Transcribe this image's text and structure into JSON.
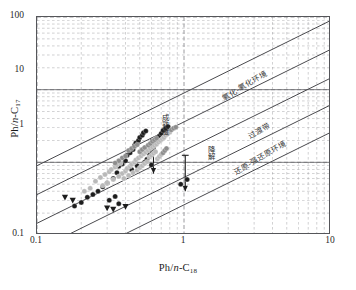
{
  "axes": {
    "x_title_pre": "Ph/",
    "x_title_it": "n",
    "x_title_post": "-C",
    "x_title_sub": "18",
    "y_title_pre": "Ph/",
    "y_title_it": "n",
    "y_title_post": "-C",
    "y_title_sub": "17",
    "x_ticks": [
      "0.1",
      "1",
      "10"
    ],
    "y_ticks": [
      "100",
      "10",
      "1",
      "0.1"
    ]
  },
  "annotations": {
    "band_upper": "氧化-氧化环境",
    "band_middle": "过渡带",
    "band_lower": "还原-强还原环境",
    "arrow_left": "成熟度",
    "arrow_right": "降解"
  },
  "colors": {
    "frame": "#55565a",
    "grid_major": "#8a8a8e",
    "grid_minor": "#9a9a9e",
    "trend_line": "#4a4a4e",
    "marker_dark": "#1d1d1d",
    "marker_light": "#b9b9b9",
    "marker_mid": "#8d8d8d"
  },
  "chart_data": {
    "type": "scatter",
    "title": "",
    "xlabel": "Ph/n-C18",
    "ylabel": "Ph/n-C17",
    "xscale": "log",
    "yscale": "log",
    "xlim": [
      0.1,
      10
    ],
    "ylim": [
      0.1,
      100
    ],
    "grid": true,
    "legend": "none",
    "trend_lines": [
      {
        "name": "line-1",
        "slope": 1,
        "intercept_at_x1": 9.0
      },
      {
        "name": "line-2",
        "slope": 1,
        "intercept_at_x1": 3.6
      },
      {
        "name": "line-3",
        "slope": 1,
        "intercept_at_x1": 1.45
      },
      {
        "name": "line-4",
        "slope": 1,
        "intercept_at_x1": 0.62
      },
      {
        "name": "line-5",
        "slope": 1,
        "intercept_at_x1": 0.26
      }
    ],
    "series": [
      {
        "name": "dark-circles",
        "marker": "filled-circle",
        "color": "#1d1d1d",
        "points": [
          [
            0.3,
            0.52
          ],
          [
            0.33,
            0.6
          ],
          [
            0.35,
            0.72
          ],
          [
            0.36,
            0.88
          ],
          [
            0.38,
            0.95
          ],
          [
            0.4,
            1.05
          ],
          [
            0.41,
            1.25
          ],
          [
            0.43,
            1.35
          ],
          [
            0.45,
            1.5
          ],
          [
            0.46,
            1.7
          ],
          [
            0.47,
            1.85
          ],
          [
            0.49,
            2.0
          ],
          [
            0.5,
            2.2
          ],
          [
            0.52,
            2.35
          ],
          [
            0.53,
            2.55
          ],
          [
            0.55,
            2.7
          ],
          [
            0.56,
            1.1
          ],
          [
            0.58,
            1.3
          ],
          [
            0.6,
            1.45
          ],
          [
            0.62,
            1.6
          ],
          [
            0.64,
            1.8
          ],
          [
            0.66,
            2.05
          ],
          [
            0.68,
            2.3
          ],
          [
            0.7,
            2.5
          ],
          [
            0.26,
            0.4
          ],
          [
            0.28,
            0.46
          ],
          [
            0.24,
            0.36
          ],
          [
            0.22,
            0.33
          ],
          [
            0.31,
            0.3
          ],
          [
            0.34,
            0.34
          ],
          [
            0.2,
            0.28
          ],
          [
            0.18,
            0.25
          ],
          [
            0.36,
            0.27
          ],
          [
            0.44,
            0.8
          ],
          [
            0.48,
            0.9
          ],
          [
            0.54,
            1.0
          ],
          [
            0.72,
            2.75
          ],
          [
            0.75,
            2.95
          ],
          [
            0.78,
            3.1
          ],
          [
            0.6,
            0.92
          ],
          [
            1.05,
            0.58
          ],
          [
            0.95,
            0.5
          ]
        ]
      },
      {
        "name": "light-circles",
        "marker": "filled-circle",
        "color": "#b9b9b9",
        "points": [
          [
            0.25,
            0.55
          ],
          [
            0.27,
            0.62
          ],
          [
            0.29,
            0.68
          ],
          [
            0.31,
            0.74
          ],
          [
            0.32,
            0.8
          ],
          [
            0.34,
            0.86
          ],
          [
            0.35,
            0.92
          ],
          [
            0.37,
            0.97
          ],
          [
            0.38,
            0.7
          ],
          [
            0.4,
            0.76
          ],
          [
            0.41,
            0.82
          ],
          [
            0.43,
            0.88
          ],
          [
            0.44,
            0.94
          ],
          [
            0.46,
            1.0
          ],
          [
            0.47,
            1.08
          ],
          [
            0.49,
            1.15
          ],
          [
            0.28,
            0.48
          ],
          [
            0.3,
            0.52
          ],
          [
            0.33,
            0.58
          ],
          [
            0.36,
            0.64
          ],
          [
            0.39,
            0.6
          ],
          [
            0.42,
            0.66
          ],
          [
            0.45,
            0.72
          ],
          [
            0.48,
            0.78
          ],
          [
            0.5,
            0.84
          ],
          [
            0.52,
            0.9
          ],
          [
            0.54,
            0.96
          ],
          [
            0.56,
            1.02
          ],
          [
            0.51,
            1.22
          ],
          [
            0.53,
            1.3
          ],
          [
            0.55,
            1.38
          ],
          [
            0.57,
            1.46
          ],
          [
            0.59,
            1.55
          ],
          [
            0.61,
            1.62
          ],
          [
            0.63,
            1.7
          ],
          [
            0.65,
            1.78
          ],
          [
            0.58,
            1.18
          ],
          [
            0.6,
            1.25
          ],
          [
            0.62,
            1.33
          ],
          [
            0.64,
            1.4
          ],
          [
            0.67,
            1.9
          ],
          [
            0.69,
            2.0
          ],
          [
            0.71,
            2.1
          ],
          [
            0.73,
            2.2
          ],
          [
            0.66,
            1.12
          ],
          [
            0.68,
            1.2
          ],
          [
            0.7,
            1.28
          ],
          [
            0.23,
            0.44
          ],
          [
            0.21,
            0.4
          ],
          [
            0.75,
            2.35
          ],
          [
            0.77,
            2.45
          ],
          [
            0.8,
            2.6
          ]
        ]
      },
      {
        "name": "mid-gray-circles",
        "marker": "filled-circle",
        "color": "#8d8d8d",
        "points": [
          [
            0.42,
            1.45
          ],
          [
            0.44,
            1.55
          ],
          [
            0.46,
            1.65
          ],
          [
            0.48,
            1.75
          ],
          [
            0.5,
            1.4
          ],
          [
            0.52,
            1.5
          ],
          [
            0.54,
            1.6
          ],
          [
            0.57,
            1.72
          ],
          [
            0.59,
            1.82
          ],
          [
            0.61,
            1.95
          ],
          [
            0.63,
            2.05
          ],
          [
            0.65,
            2.15
          ],
          [
            0.38,
            1.15
          ],
          [
            0.4,
            1.22
          ],
          [
            0.36,
            1.05
          ],
          [
            0.34,
            0.98
          ],
          [
            0.72,
            1.35
          ],
          [
            0.74,
            1.45
          ],
          [
            0.76,
            1.55
          ],
          [
            0.82,
            2.8
          ],
          [
            0.85,
            2.95
          ],
          [
            0.88,
            3.05
          ]
        ]
      },
      {
        "name": "triangles",
        "marker": "filled-triangle-down",
        "color": "#1d1d1d",
        "points": [
          [
            0.155,
            0.33
          ],
          [
            0.175,
            0.3
          ],
          [
            0.3,
            0.235
          ],
          [
            0.33,
            0.225
          ],
          [
            0.4,
            0.245
          ]
        ]
      }
    ]
  }
}
